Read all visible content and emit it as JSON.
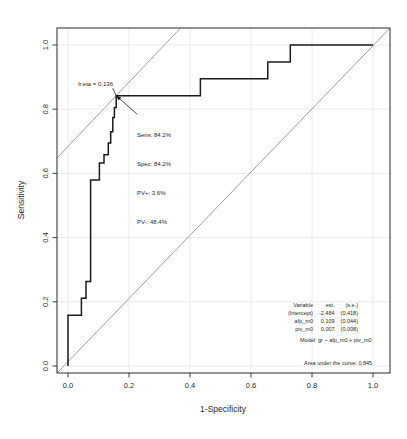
{
  "figure": {
    "bg": "#ffffff",
    "frame_color": "#3d3d3d",
    "grid_color": "#e4e4e4",
    "curve_color": "#1b1b1b",
    "ref_color": "#929292",
    "text_color": "#1f1f1f"
  },
  "chart_data": {
    "type": "line",
    "title": "",
    "xlabel": "1-Specificity",
    "ylabel": "Sensitivity",
    "xlim": [
      -0.036,
      1.056
    ],
    "ylim": [
      -0.022,
      1.053
    ],
    "grid": true,
    "xticks": [
      0,
      0.2,
      0.4,
      0.6,
      0.8,
      1.0
    ],
    "xtick_labels": [
      "0.0",
      "0.2",
      "0.4",
      "0.6",
      "0.8",
      "1.0"
    ],
    "yticks": [
      0,
      0.2,
      0.4,
      0.6,
      0.8,
      1.0
    ],
    "ytick_labels": [
      "0.0",
      "0.2",
      "0.4",
      "0.6",
      "0.8",
      "1.0"
    ],
    "series": [
      {
        "name": "roc-curve",
        "type": "step",
        "points": [
          [
            0,
            0
          ],
          [
            0,
            0.158
          ],
          [
            0.044,
            0.158
          ],
          [
            0.044,
            0.211
          ],
          [
            0.059,
            0.211
          ],
          [
            0.059,
            0.263
          ],
          [
            0.074,
            0.263
          ],
          [
            0.074,
            0.579
          ],
          [
            0.103,
            0.579
          ],
          [
            0.103,
            0.632
          ],
          [
            0.118,
            0.632
          ],
          [
            0.118,
            0.658
          ],
          [
            0.132,
            0.658
          ],
          [
            0.132,
            0.695
          ],
          [
            0.14,
            0.695
          ],
          [
            0.14,
            0.73
          ],
          [
            0.147,
            0.73
          ],
          [
            0.147,
            0.774
          ],
          [
            0.152,
            0.774
          ],
          [
            0.152,
            0.805
          ],
          [
            0.158,
            0.805
          ],
          [
            0.158,
            0.842
          ],
          [
            0.434,
            0.842
          ],
          [
            0.434,
            0.895
          ],
          [
            0.655,
            0.895
          ],
          [
            0.655,
            0.947
          ],
          [
            0.729,
            0.947
          ],
          [
            0.729,
            1.0
          ],
          [
            1.0,
            1.0
          ]
        ]
      },
      {
        "name": "chance-diagonal",
        "type": "line",
        "points": [
          [
            -0.036,
            -0.022
          ],
          [
            1.056,
            1.053
          ]
        ]
      },
      {
        "name": "optimal-tangent",
        "type": "line",
        "points": [
          [
            -0.036,
            0.648
          ],
          [
            0.369,
            1.053
          ]
        ]
      }
    ],
    "optimal_point": {
      "x": 0.158,
      "y": 0.842
    },
    "annotations": {
      "cutoff_label": "lr.eta = 0.136",
      "stats_lines": [
        "Sens: 84.2%",
        "Spec: 84.2%",
        "PV+: 3.6%",
        "PV-: 48.4%"
      ],
      "model_label": "Model: gr ~ afp_m0 + piv_m0",
      "auc_label": "Area under the curve: 0.845",
      "coef_table": {
        "headers": [
          "Variable",
          "est.",
          "(s.e.)"
        ],
        "rows": [
          [
            "(Intercept)",
            "-2.484",
            "(0.418)"
          ],
          [
            "afp_m0",
            "0.109",
            "(0.044)"
          ],
          [
            "piv_m0",
            "0.007",
            "(0.008)"
          ]
        ]
      }
    }
  }
}
